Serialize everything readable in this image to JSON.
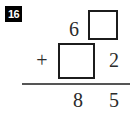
{
  "problem": {
    "number_label": "16",
    "operator": "+",
    "type": "vertical-addition",
    "columns": [
      "tens",
      "ones"
    ],
    "rows": {
      "addend_top": {
        "tens": "6",
        "ones": ""
      },
      "addend_bottom": {
        "tens": "",
        "ones": "2"
      },
      "sum": {
        "tens": "8",
        "ones": "5"
      }
    },
    "blanks": [
      {
        "id": "top-ones-box",
        "row": "addend_top",
        "column": "ones",
        "value": ""
      },
      {
        "id": "bottom-tens-box",
        "row": "addend_bottom",
        "column": "tens",
        "value": ""
      }
    ]
  },
  "colors": {
    "background": "#ffffff",
    "ink": "#2b2b2b",
    "box_border": "#1c1c1c",
    "rule": "#555555",
    "badge_background": "#000000",
    "badge_text": "#ffffff"
  }
}
